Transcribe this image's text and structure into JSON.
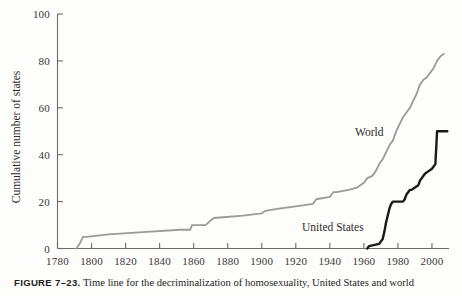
{
  "figure": {
    "caption_label": "FIGURE 7–23.",
    "caption_text": "Time line for the decriminalization of homosexuality, United States and world"
  },
  "chart_data": {
    "type": "line",
    "title": "",
    "xlabel": "",
    "ylabel": "Cumulative number of states",
    "xlim": [
      1780,
      2010
    ],
    "ylim": [
      0,
      100
    ],
    "grid": false,
    "legend": "inline-annotations",
    "x_ticks": [
      1780,
      1800,
      1820,
      1840,
      1860,
      1880,
      1900,
      1920,
      1940,
      1960,
      1980,
      2000
    ],
    "y_ticks": [
      0,
      20,
      40,
      60,
      80,
      100
    ],
    "colors": {
      "world": "#9a9a98",
      "united_states": "#1a1a1a",
      "axis": "#6d6a68"
    },
    "series": [
      {
        "name": "World",
        "color": "#9a9a98",
        "label_position": {
          "x": 1958,
          "y": 46
        },
        "points": [
          [
            1791,
            0
          ],
          [
            1792,
            1
          ],
          [
            1793,
            2
          ],
          [
            1795,
            5
          ],
          [
            1797,
            5
          ],
          [
            1810,
            6
          ],
          [
            1830,
            7
          ],
          [
            1852,
            8
          ],
          [
            1858,
            8
          ],
          [
            1859,
            10
          ],
          [
            1867,
            10
          ],
          [
            1870,
            12
          ],
          [
            1872,
            13
          ],
          [
            1889,
            14
          ],
          [
            1900,
            15
          ],
          [
            1902,
            16
          ],
          [
            1910,
            17
          ],
          [
            1920,
            18
          ],
          [
            1930,
            19
          ],
          [
            1932,
            21
          ],
          [
            1940,
            22
          ],
          [
            1942,
            24
          ],
          [
            1944,
            24
          ],
          [
            1951,
            25
          ],
          [
            1956,
            26
          ],
          [
            1960,
            28
          ],
          [
            1962,
            30
          ],
          [
            1965,
            31
          ],
          [
            1967,
            33
          ],
          [
            1969,
            36
          ],
          [
            1971,
            38
          ],
          [
            1973,
            41
          ],
          [
            1975,
            44
          ],
          [
            1977,
            46
          ],
          [
            1979,
            50
          ],
          [
            1981,
            53
          ],
          [
            1983,
            56
          ],
          [
            1985,
            58
          ],
          [
            1987,
            60
          ],
          [
            1989,
            63
          ],
          [
            1991,
            66
          ],
          [
            1993,
            70
          ],
          [
            1995,
            72
          ],
          [
            1997,
            73
          ],
          [
            1999,
            75
          ],
          [
            2001,
            77
          ],
          [
            2003,
            80
          ],
          [
            2005,
            82
          ],
          [
            2007,
            83
          ]
        ]
      },
      {
        "name": "United States",
        "color": "#1a1a1a",
        "label_position": {
          "x": 1888,
          "y": 8
        },
        "points": [
          [
            1962,
            0
          ],
          [
            1963,
            1
          ],
          [
            1969,
            2
          ],
          [
            1971,
            4
          ],
          [
            1972,
            7
          ],
          [
            1973,
            11
          ],
          [
            1974,
            14
          ],
          [
            1975,
            17
          ],
          [
            1976,
            19
          ],
          [
            1977,
            20
          ],
          [
            1978,
            20
          ],
          [
            1983,
            20
          ],
          [
            1984,
            21
          ],
          [
            1985,
            23
          ],
          [
            1986,
            24
          ],
          [
            1987,
            25
          ],
          [
            1988,
            25
          ],
          [
            1990,
            26
          ],
          [
            1992,
            27
          ],
          [
            1993,
            29
          ],
          [
            1994,
            30
          ],
          [
            1995,
            31
          ],
          [
            1996,
            32
          ],
          [
            1998,
            33
          ],
          [
            2000,
            34
          ],
          [
            2002,
            36
          ],
          [
            2003,
            50
          ],
          [
            2009,
            50
          ]
        ]
      }
    ]
  }
}
